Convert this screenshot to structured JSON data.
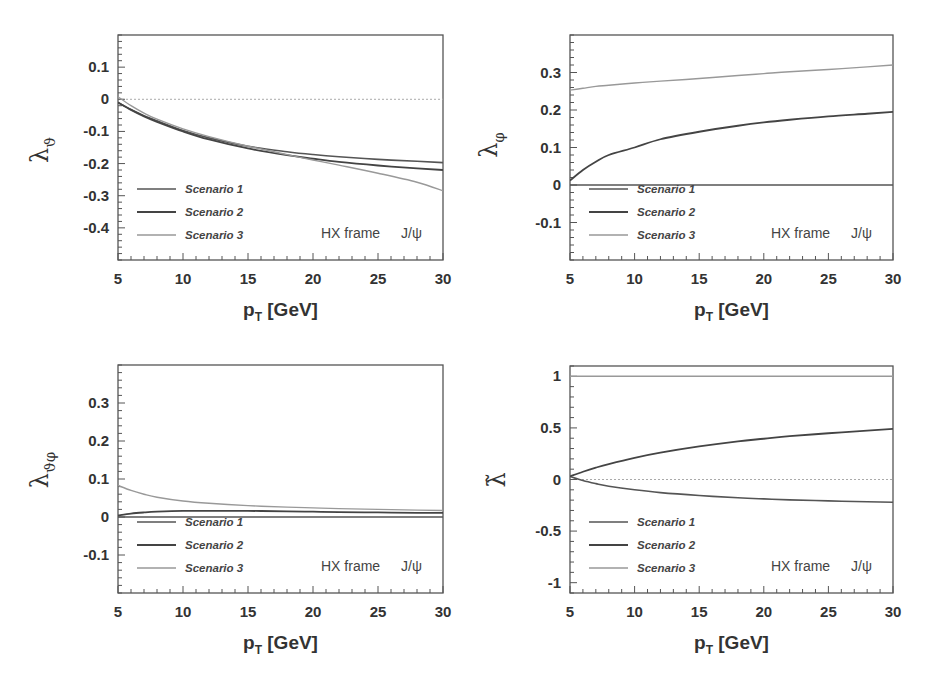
{
  "figure": {
    "annotation_frame": "HX frame",
    "annotation_particle": "J/ψ",
    "xlabel_main": "p",
    "xlabel_sub": "T",
    "xlabel_unit": " [GeV]"
  },
  "legend": [
    {
      "label": "Scenario 1",
      "color": "#555555",
      "width": 1.6
    },
    {
      "label": "Scenario 2",
      "color": "#444444",
      "width": 1.8
    },
    {
      "label": "Scenario 3",
      "color": "#999999",
      "width": 1.4
    }
  ],
  "chart_data": [
    {
      "id": "lambda_theta",
      "type": "line",
      "title": "",
      "ylabel": "λ_ϑ",
      "ylabel_main": "λ",
      "ylabel_sub": "ϑ",
      "ylabel_tilde": false,
      "xlabel": "p_T [GeV]",
      "xlim": [
        5,
        30
      ],
      "ylim": [
        -0.5,
        0.2
      ],
      "xticks": [
        5,
        10,
        15,
        20,
        25,
        30
      ],
      "xtick_labels": [
        "5",
        "10",
        "15",
        "20",
        "25",
        "30"
      ],
      "yticks": [
        -0.4,
        -0.3,
        -0.2,
        -0.1,
        0,
        0.1
      ],
      "ytick_labels": [
        "-0.4",
        "-0.3",
        "-0.2",
        "-0.1",
        "0",
        "0.1"
      ],
      "yminor_step": 0.02,
      "xminor_step": 1,
      "reference_line": 0,
      "grid": false,
      "legend_position": "lower left",
      "annotation": "HX frame   J/ψ",
      "x": [
        5,
        6,
        7,
        8,
        10,
        12,
        15,
        18,
        20,
        22,
        25,
        28,
        30
      ],
      "series": [
        {
          "name": "Scenario 1",
          "values": [
            -0.01,
            -0.032,
            -0.051,
            -0.067,
            -0.097,
            -0.12,
            -0.146,
            -0.163,
            -0.172,
            -0.179,
            -0.187,
            -0.193,
            -0.197
          ]
        },
        {
          "name": "Scenario 2",
          "values": [
            -0.01,
            -0.033,
            -0.053,
            -0.07,
            -0.1,
            -0.125,
            -0.153,
            -0.174,
            -0.185,
            -0.195,
            -0.206,
            -0.215,
            -0.22
          ]
        },
        {
          "name": "Scenario 3",
          "values": [
            0.008,
            -0.02,
            -0.043,
            -0.062,
            -0.092,
            -0.116,
            -0.146,
            -0.172,
            -0.189,
            -0.205,
            -0.23,
            -0.258,
            -0.285
          ]
        }
      ],
      "frame": {
        "left": 118,
        "top": 35,
        "right": 443,
        "bottom": 260
      },
      "ylabel_pos": {
        "x": 48,
        "y": 150
      }
    },
    {
      "id": "lambda_phi",
      "type": "line",
      "title": "",
      "ylabel": "λ_φ",
      "ylabel_main": "λ",
      "ylabel_sub": "φ",
      "ylabel_tilde": false,
      "xlabel": "p_T [GeV]",
      "xlim": [
        5,
        30
      ],
      "ylim": [
        -0.2,
        0.4
      ],
      "xticks": [
        5,
        10,
        15,
        20,
        25,
        30
      ],
      "xtick_labels": [
        "5",
        "10",
        "15",
        "20",
        "25",
        "30"
      ],
      "yticks": [
        -0.1,
        0,
        0.1,
        0.2,
        0.3
      ],
      "ytick_labels": [
        "-0.1",
        "0",
        "0.1",
        "0.2",
        "0.3"
      ],
      "yminor_step": 0.02,
      "xminor_step": 1,
      "reference_line": null,
      "grid": false,
      "legend_position": "lower left",
      "annotation": "HX frame   J/ψ",
      "x": [
        5,
        6,
        7,
        8,
        10,
        12,
        15,
        18,
        20,
        22,
        25,
        28,
        30
      ],
      "series": [
        {
          "name": "Scenario 1",
          "values": [
            0,
            0,
            0,
            0,
            0,
            0,
            0,
            0,
            0,
            0,
            0,
            0,
            0
          ]
        },
        {
          "name": "Scenario 2",
          "values": [
            0.012,
            0.04,
            0.062,
            0.08,
            0.1,
            0.122,
            0.142,
            0.158,
            0.167,
            0.174,
            0.183,
            0.19,
            0.195
          ]
        },
        {
          "name": "Scenario 3",
          "values": [
            0.253,
            0.258,
            0.263,
            0.266,
            0.272,
            0.277,
            0.284,
            0.292,
            0.297,
            0.302,
            0.308,
            0.315,
            0.32
          ]
        }
      ],
      "frame": {
        "left": 570,
        "top": 35,
        "right": 893,
        "bottom": 260
      },
      "ylabel_pos": {
        "x": 497,
        "y": 145
      }
    },
    {
      "id": "lambda_theta_phi",
      "type": "line",
      "title": "",
      "ylabel": "λ_ϑφ",
      "ylabel_main": "λ",
      "ylabel_sub": "ϑφ",
      "ylabel_tilde": false,
      "xlabel": "p_T [GeV]",
      "xlim": [
        5,
        30
      ],
      "ylim": [
        -0.2,
        0.4
      ],
      "xticks": [
        5,
        10,
        15,
        20,
        25,
        30
      ],
      "xtick_labels": [
        "5",
        "10",
        "15",
        "20",
        "25",
        "30"
      ],
      "yticks": [
        -0.1,
        0,
        0.1,
        0.2,
        0.3
      ],
      "ytick_labels": [
        "-0.1",
        "0",
        "0.1",
        "0.2",
        "0.3"
      ],
      "yminor_step": 0.02,
      "xminor_step": 1,
      "reference_line": null,
      "grid": false,
      "legend_position": "lower left",
      "annotation": "HX frame   J/ψ",
      "x": [
        5,
        6,
        7,
        8,
        10,
        12,
        15,
        18,
        20,
        22,
        25,
        28,
        30
      ],
      "series": [
        {
          "name": "Scenario 1",
          "values": [
            0,
            0,
            0,
            0,
            0,
            0,
            0,
            0,
            0,
            0,
            0,
            0,
            0
          ]
        },
        {
          "name": "Scenario 2",
          "values": [
            0.004,
            0.009,
            0.012,
            0.014,
            0.016,
            0.016,
            0.016,
            0.015,
            0.014,
            0.013,
            0.012,
            0.011,
            0.011
          ]
        },
        {
          "name": "Scenario 3",
          "values": [
            0.083,
            0.07,
            0.06,
            0.052,
            0.042,
            0.036,
            0.03,
            0.026,
            0.024,
            0.022,
            0.02,
            0.018,
            0.017
          ]
        }
      ],
      "frame": {
        "left": 118,
        "top": 365,
        "right": 443,
        "bottom": 593
      },
      "ylabel_pos": {
        "x": 48,
        "y": 470
      }
    },
    {
      "id": "lambda_tilde",
      "type": "line",
      "title": "",
      "ylabel": "λ̃",
      "ylabel_main": "λ",
      "ylabel_sub": "",
      "ylabel_tilde": true,
      "xlabel": "p_T [GeV]",
      "xlim": [
        5,
        30
      ],
      "ylim": [
        -1.1,
        1.1
      ],
      "xticks": [
        5,
        10,
        15,
        20,
        25,
        30
      ],
      "xtick_labels": [
        "5",
        "10",
        "15",
        "20",
        "25",
        "30"
      ],
      "yticks": [
        -1,
        -0.5,
        0,
        0.5,
        1
      ],
      "ytick_labels": [
        "-1",
        "-0.5",
        "0",
        "0.5",
        "1"
      ],
      "yminor_step": 0.1,
      "xminor_step": 1,
      "reference_line": 0,
      "grid": false,
      "legend_position": "lower left",
      "annotation": "HX frame   J/ψ",
      "x": [
        5,
        6,
        7,
        8,
        10,
        12,
        15,
        18,
        20,
        22,
        25,
        28,
        30
      ],
      "series": [
        {
          "name": "Scenario 1",
          "values": [
            0.03,
            -0.01,
            -0.04,
            -0.065,
            -0.1,
            -0.127,
            -0.155,
            -0.177,
            -0.188,
            -0.197,
            -0.207,
            -0.216,
            -0.22
          ]
        },
        {
          "name": "Scenario 2",
          "values": [
            0.03,
            0.075,
            0.115,
            0.15,
            0.21,
            0.26,
            0.32,
            0.37,
            0.395,
            0.42,
            0.448,
            0.474,
            0.49
          ]
        },
        {
          "name": "Scenario 3",
          "values": [
            1,
            1,
            1,
            1,
            1,
            1,
            1,
            1,
            1,
            1,
            1,
            1,
            1
          ]
        }
      ],
      "frame": {
        "left": 570,
        "top": 366,
        "right": 893,
        "bottom": 593
      },
      "ylabel_pos": {
        "x": 505,
        "y": 480
      }
    }
  ]
}
